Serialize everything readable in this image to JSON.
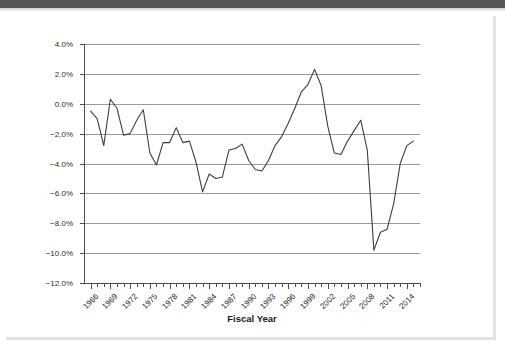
{
  "window": {
    "top_bar_color": "#565656",
    "page_background": "#ffffff"
  },
  "chart_data": {
    "type": "line",
    "title": "",
    "xlabel": "Fiscal Year",
    "ylabel": "Budget Surplus/Deficit as Percentage of GDP",
    "ylim": [
      -12.0,
      4.0
    ],
    "xlim": [
      1965,
      2016
    ],
    "ytick_labels": [
      "4.0%",
      "2.0%",
      "0.0%",
      "−2.0%",
      "−4.0%",
      "−6.0%",
      "−8.0%",
      "−10.0%",
      "−12.0%"
    ],
    "ytick_values": [
      4.0,
      2.0,
      0.0,
      -2.0,
      -4.0,
      -6.0,
      -8.0,
      -10.0,
      -12.0
    ],
    "xtick_labels": [
      "1966",
      "1969",
      "1972",
      "1975",
      "1978",
      "1981",
      "1984",
      "1987",
      "1990",
      "1993",
      "1996",
      "1999",
      "2002",
      "2005",
      "2008",
      "2011",
      "2014"
    ],
    "xtick_values": [
      1966,
      1969,
      1972,
      1975,
      1978,
      1981,
      1984,
      1987,
      1990,
      1993,
      1996,
      1999,
      2002,
      2005,
      2008,
      2011,
      2014
    ],
    "grid": "horizontal",
    "legend": "none",
    "line_color": "#3d3d3d",
    "x": [
      1966,
      1967,
      1968,
      1969,
      1970,
      1971,
      1972,
      1973,
      1974,
      1975,
      1976,
      1977,
      1978,
      1979,
      1980,
      1981,
      1982,
      1983,
      1984,
      1985,
      1986,
      1987,
      1988,
      1989,
      1990,
      1991,
      1992,
      1993,
      1994,
      1995,
      1996,
      1997,
      1998,
      1999,
      2000,
      2001,
      2002,
      2003,
      2004,
      2005,
      2006,
      2007,
      2008,
      2009,
      2010,
      2011,
      2012,
      2013,
      2014,
      2015
    ],
    "values": [
      -0.5,
      -1.0,
      -2.8,
      0.3,
      -0.3,
      -2.1,
      -2.0,
      -1.1,
      -0.4,
      -3.3,
      -4.1,
      -2.6,
      -2.6,
      -1.6,
      -2.6,
      -2.5,
      -3.9,
      -5.9,
      -4.7,
      -5.0,
      -4.9,
      -3.1,
      -3.0,
      -2.7,
      -3.8,
      -4.4,
      -4.5,
      -3.8,
      -2.8,
      -2.2,
      -1.3,
      -0.3,
      0.8,
      1.3,
      2.3,
      1.2,
      -1.5,
      -3.3,
      -3.4,
      -2.5,
      -1.8,
      -1.1,
      -3.1,
      -9.8,
      -8.6,
      -8.4,
      -6.7,
      -4.0,
      -2.8,
      -2.5
    ],
    "units": "percent of GDP"
  },
  "axes": {
    "y_title": "Budget Surplus/Deficit as Percentage of GDP",
    "x_title": "Fiscal Year"
  }
}
